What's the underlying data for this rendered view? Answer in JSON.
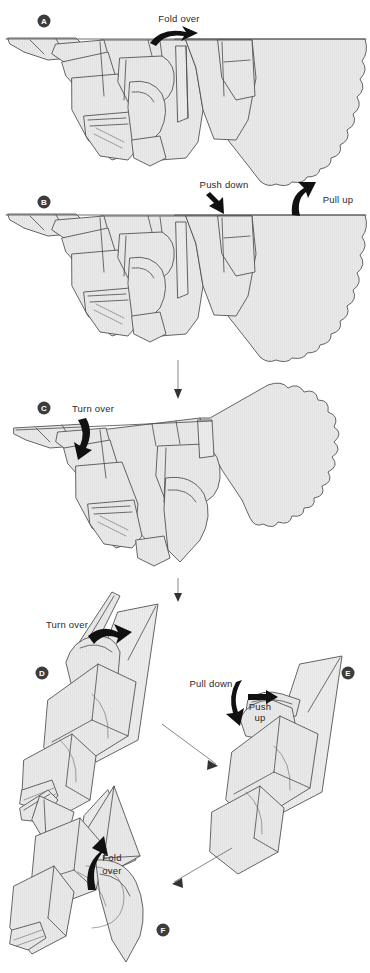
{
  "document": {
    "type": "origami-instruction-diagram",
    "subject": "folded paper bird / wing model",
    "background_color": "#ffffff",
    "paper_fill_color": "#e8e8e8",
    "line_color": "#4a4a4a",
    "arrow_color": "#111111",
    "badge_color": "#3c3c3c",
    "badge_text_color": "#ffffff"
  },
  "steps": [
    {
      "id": "A",
      "badge_label": "A",
      "badge_x": 44,
      "badge_y": 21,
      "instructions": [
        {
          "name": "fold-over",
          "text": "Fold over",
          "x": 179,
          "y": 22,
          "arrow": "curved-right"
        }
      ]
    },
    {
      "id": "B",
      "badge_label": "B",
      "badge_x": 44,
      "badge_y": 202,
      "instructions": [
        {
          "name": "push-down",
          "text": "Push down",
          "x": 224,
          "y": 188,
          "arrow": "straight-down-left"
        },
        {
          "name": "pull-up",
          "text": "Pull up",
          "x": 338,
          "y": 203,
          "arrow": "curved-up"
        }
      ]
    },
    {
      "id": "C",
      "badge_label": "C",
      "badge_x": 44,
      "badge_y": 408,
      "instructions": [
        {
          "name": "turn-over",
          "text": "Turn over",
          "x": 93,
          "y": 410,
          "arrow": "curved-down-left"
        }
      ]
    },
    {
      "id": "D",
      "badge_label": "D",
      "badge_x": 42,
      "badge_y": 673,
      "instructions": [
        {
          "name": "turn-over",
          "text": "Turn over",
          "x": 67,
          "y": 625,
          "arrow": "curved-right"
        }
      ]
    },
    {
      "id": "E",
      "badge_label": "E",
      "badge_x": 348,
      "badge_y": 673,
      "instructions": [
        {
          "name": "pull-down",
          "text": "Pull down",
          "x": 211,
          "y": 684,
          "arrow": "curved-down"
        },
        {
          "name": "push-up-line1",
          "text": "Push",
          "x": 260,
          "y": 707,
          "arrow": "straight-right"
        },
        {
          "name": "push-up-line2",
          "text": "up",
          "x": 260,
          "y": 718,
          "arrow": "none"
        }
      ]
    },
    {
      "id": "F",
      "badge_label": "F",
      "badge_x": 163,
      "badge_y": 930,
      "instructions": [
        {
          "name": "fold-over-line1",
          "text": "Fold",
          "x": 112,
          "y": 858,
          "arrow": "curved-up-left"
        },
        {
          "name": "fold-over-line2",
          "text": "over",
          "x": 112,
          "y": 871,
          "arrow": "none"
        }
      ]
    }
  ],
  "transition_arrows": [
    {
      "name": "arrow-b-to-c",
      "direction": "down",
      "from_step": "B",
      "to_step": "C"
    },
    {
      "name": "arrow-c-to-d",
      "direction": "down",
      "from_step": "C",
      "to_step": "D"
    },
    {
      "name": "arrow-d-to-e",
      "direction": "down-right",
      "from_step": "D",
      "to_step": "E"
    },
    {
      "name": "arrow-e-to-f",
      "direction": "down-left",
      "from_step": "E",
      "to_step": "F"
    }
  ]
}
